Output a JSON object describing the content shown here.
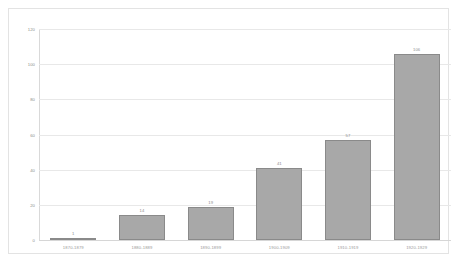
{
  "chart_data": {
    "type": "bar",
    "title": "",
    "subtitle": "",
    "xlabel": "",
    "ylabel": "",
    "categories": [
      "1870-1879",
      "1880-1889",
      "1890-1899",
      "1900-1909",
      "1910-1919",
      "1920-1929"
    ],
    "values": [
      1,
      14,
      19,
      41,
      57,
      106
    ],
    "data_labels": [
      "1",
      "14",
      "19",
      "41",
      "57",
      "106"
    ],
    "ylim": [
      0,
      120
    ],
    "yticks": [
      0,
      20,
      40,
      60,
      80,
      100,
      120
    ],
    "ytick_labels": [
      "0",
      "20",
      "40",
      "60",
      "80",
      "100",
      "120"
    ],
    "grid": true,
    "legend": false,
    "legend_position": "none",
    "colors": {
      "bar_fill": "#a8a8a8",
      "bar_border": "#8a8a8a",
      "gridline": "#e8e8e8",
      "axis": "#d9d9d9",
      "frame": "#e3e3e3",
      "tick_text": "#8d8d8d",
      "category_text": "#9a9a9a",
      "background": "#ffffff"
    }
  }
}
